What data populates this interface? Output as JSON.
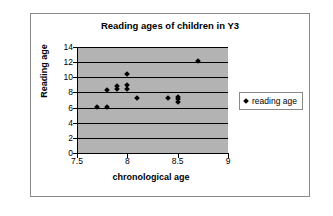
{
  "chart_data": {
    "type": "scatter",
    "title": "Reading ages of children in Y3",
    "xlabel": "chronological age",
    "ylabel": "Reading age",
    "xlim": [
      7.5,
      9
    ],
    "ylim": [
      0,
      14
    ],
    "xticks": [
      "7.5",
      "8",
      "8.5",
      "9"
    ],
    "xtick_values": [
      7.5,
      8,
      8.5,
      9
    ],
    "yticks": [
      "0",
      "2",
      "4",
      "6",
      "8",
      "10",
      "12",
      "14"
    ],
    "ytick_values": [
      0,
      2,
      4,
      6,
      8,
      10,
      12,
      14
    ],
    "grid": "horizontal",
    "legend_position": "right",
    "plot_background": "#b3b3b3",
    "marker_color": "#000000",
    "marker_shape": "diamond",
    "series": [
      {
        "name": "reading age",
        "points": [
          {
            "x": 7.7,
            "y": 6.1
          },
          {
            "x": 7.8,
            "y": 6.1
          },
          {
            "x": 7.8,
            "y": 8.3
          },
          {
            "x": 7.9,
            "y": 8.4
          },
          {
            "x": 7.9,
            "y": 8.8
          },
          {
            "x": 8.0,
            "y": 8.4
          },
          {
            "x": 8.0,
            "y": 9.0
          },
          {
            "x": 8.0,
            "y": 10.4
          },
          {
            "x": 8.1,
            "y": 7.3
          },
          {
            "x": 8.4,
            "y": 7.3
          },
          {
            "x": 8.5,
            "y": 6.8
          },
          {
            "x": 8.5,
            "y": 7.1
          },
          {
            "x": 8.5,
            "y": 7.4
          },
          {
            "x": 8.7,
            "y": 12.2
          }
        ]
      }
    ]
  },
  "legend": {
    "entries": [
      {
        "label": "reading age"
      }
    ]
  }
}
